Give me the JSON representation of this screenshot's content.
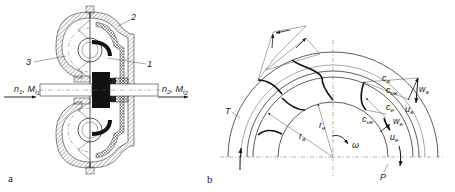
{
  "figure": {
    "panel_a": {
      "label": "a",
      "parts": [
        {
          "id": "1",
          "label": "1"
        },
        {
          "id": "2",
          "label": "2"
        },
        {
          "id": "3",
          "label": "3"
        }
      ],
      "input": {
        "n": "n",
        "n_sub": "1",
        "sep": ", ",
        "M": "M",
        "M_sub": "t",
        "M_subsub": "1"
      },
      "output": {
        "n": "n",
        "n_sub": "2",
        "sep": ", ",
        "M": "M",
        "M_sub": "t",
        "M_subsub": "2"
      }
    },
    "panel_b": {
      "label": "b",
      "labels": {
        "ca": "c",
        "ca_sub": "a",
        "cua": "c",
        "cua_sub": "ua",
        "wa": "w",
        "wa_sub": "a",
        "ua": "u",
        "ua_sub": "a",
        "ce": "c",
        "ce_sub": "e",
        "cue": "c",
        "cue_sub": "ue",
        "we": "w",
        "we_sub": "e",
        "ue": "u",
        "ue_sub": "e",
        "T": "T",
        "re": "r",
        "re_sub": "e",
        "ra": "r",
        "ra_sub": "a",
        "omega": "ω",
        "P": "P"
      }
    }
  }
}
